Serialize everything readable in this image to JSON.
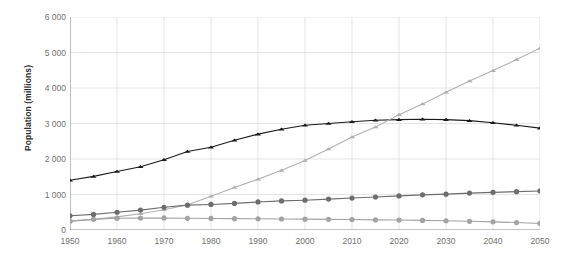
{
  "chart_data": {
    "type": "line",
    "title": "",
    "subtitle": "",
    "xlabel": "",
    "ylabel": "Population (millions)",
    "xlim": [
      1950,
      2050
    ],
    "ylim": [
      0,
      6000
    ],
    "grid": true,
    "legend_position": "none",
    "y_ticks": [
      "0",
      "1 000",
      "2 000",
      "3 000",
      "4 000",
      "5 000",
      "6 000"
    ],
    "y_tick_values": [
      0,
      1000,
      2000,
      3000,
      4000,
      5000,
      6000
    ],
    "x_ticks": [
      "1950",
      "1960",
      "1970",
      "1980",
      "1990",
      "2000",
      "2010",
      "2020",
      "2030",
      "2040",
      "2050"
    ],
    "x_tick_values": [
      1950,
      1960,
      1970,
      1980,
      1990,
      2000,
      2010,
      2020,
      2030,
      2040,
      2050
    ],
    "x": [
      1950,
      1955,
      1960,
      1965,
      1970,
      1975,
      1980,
      1985,
      1990,
      1995,
      2000,
      2005,
      2010,
      2015,
      2020,
      2025,
      2030,
      2035,
      2040,
      2045,
      2050
    ],
    "series": [
      {
        "name": "series-black-triangles",
        "marker": "triangle",
        "color": "#1a1a1a",
        "line_color": "#1a1a1a",
        "values": [
          1400,
          1510,
          1650,
          1780,
          1980,
          2210,
          2330,
          2530,
          2700,
          2840,
          2950,
          3000,
          3050,
          3090,
          3110,
          3120,
          3110,
          3080,
          3020,
          2950,
          2870
        ]
      },
      {
        "name": "series-light-triangles",
        "marker": "triangle",
        "color": "#b0b0b0",
        "line_color": "#b0b0b0",
        "values": [
          250,
          300,
          370,
          460,
          570,
          710,
          950,
          1200,
          1430,
          1680,
          1960,
          2280,
          2620,
          2900,
          3250,
          3550,
          3880,
          4200,
          4490,
          4800,
          5120
        ]
      },
      {
        "name": "series-dark-circles",
        "marker": "circle",
        "color": "#6d6d6d",
        "line_color": "#6d6d6d",
        "values": [
          400,
          440,
          500,
          560,
          640,
          700,
          720,
          750,
          790,
          820,
          840,
          870,
          900,
          930,
          960,
          990,
          1010,
          1040,
          1060,
          1080,
          1100
        ]
      },
      {
        "name": "series-light-circles",
        "marker": "circle",
        "color": "#a3a3a3",
        "line_color": "#a3a3a3",
        "values": [
          250,
          300,
          330,
          335,
          340,
          330,
          325,
          320,
          315,
          310,
          305,
          300,
          295,
          285,
          280,
          270,
          260,
          245,
          230,
          210,
          185
        ]
      }
    ]
  },
  "axis": {
    "y_title": "Population (millions)"
  },
  "caption": {
    "text": ""
  }
}
